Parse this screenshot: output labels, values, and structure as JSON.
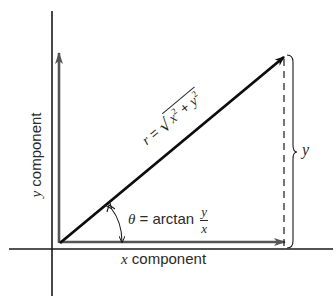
{
  "diagram": {
    "labels": {
      "y_component": {
        "var": "y",
        "text": " component"
      },
      "x_component": {
        "var": "x",
        "text": " component"
      },
      "r_equation": {
        "lhs": "r",
        "eq": " = ",
        "x_var": "x",
        "x_exp": "2",
        "plus": " + ",
        "y_var": "y",
        "y_exp": "2"
      },
      "theta_equation": {
        "lhs": "θ",
        "eq": " = ",
        "func": "arctan",
        "numerator": "y",
        "denominator": "x"
      },
      "y_brace": "y"
    },
    "geometry": {
      "origin": [
        60,
        243
      ],
      "axis_origin": [
        52,
        249
      ],
      "vector_tip": [
        284,
        57
      ],
      "vector_angle_deg": 39.7
    },
    "colors": {
      "axis": "#1a1a1a",
      "vector": "#0d0d0d",
      "component": "#555555",
      "text": "#2a2a2a"
    }
  }
}
